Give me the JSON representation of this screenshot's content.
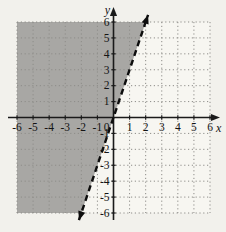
{
  "figure": {
    "background": "#f2f1ec",
    "plot_background": "#f7f6f1",
    "shade_color": "#a8a7a4",
    "grid_color": "#8e8d89",
    "axis_color": "#1a1a1a",
    "line_color": "#0d0d0d",
    "text_color": "#141414"
  },
  "chart_data": {
    "type": "line",
    "title": "",
    "xlabel": "x",
    "ylabel": "y",
    "xlim": [
      -6,
      6
    ],
    "ylim": [
      -6,
      6
    ],
    "x_ticks": [
      -6,
      -5,
      -4,
      -3,
      -2,
      -1,
      1,
      2,
      3,
      4,
      5,
      6
    ],
    "y_ticks": [
      6,
      5,
      4,
      3,
      2,
      1,
      -1,
      -2,
      -3,
      -4,
      -5,
      -6
    ],
    "origin_label": "0",
    "grid": "dotted",
    "legend": "none",
    "series": [
      {
        "name": "boundary-line",
        "equation": "y = 3x",
        "slope": 3,
        "intercept": 0,
        "style": "dashed",
        "x_extent": [
          -2.15,
          2.15
        ],
        "arrows": "both"
      }
    ],
    "shaded_region": {
      "inequality": "y > 3x",
      "side": "left-of-boundary",
      "vertices_units": [
        [
          -6,
          6
        ],
        [
          2,
          6
        ],
        [
          -2,
          -6
        ],
        [
          -6,
          -6
        ]
      ]
    }
  }
}
